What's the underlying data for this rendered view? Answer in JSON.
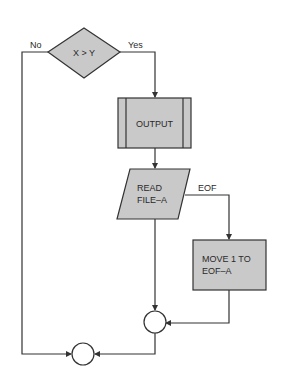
{
  "diagram": {
    "type": "flowchart",
    "colors": {
      "fill": "#c9c9c9",
      "stroke": "#333333",
      "background": "#ffffff"
    },
    "nodes": {
      "decision": {
        "shape": "diamond",
        "label": "X > Y"
      },
      "output": {
        "shape": "predefined-process",
        "label": "OUTPUT"
      },
      "read": {
        "shape": "parallelogram",
        "line1": "READ",
        "line2": "FILE–A"
      },
      "move": {
        "shape": "rectangle",
        "line1": "MOVE 1 TO",
        "line2": "EOF–A"
      },
      "connector_right": {
        "shape": "circle",
        "label": ""
      },
      "connector_bottom": {
        "shape": "circle",
        "label": ""
      }
    },
    "edges": {
      "no": {
        "label": "No",
        "from": "decision",
        "to": "connector_bottom"
      },
      "yes": {
        "label": "Yes",
        "from": "decision",
        "to": "output"
      },
      "output_to_read": {
        "label": "",
        "from": "output",
        "to": "read"
      },
      "eof": {
        "label": "EOF",
        "from": "read",
        "to": "move"
      },
      "read_to_connector": {
        "label": "",
        "from": "read",
        "to": "connector_right"
      },
      "move_to_connector": {
        "label": "",
        "from": "move",
        "to": "connector_right"
      },
      "connector_to_bottom": {
        "label": "",
        "from": "connector_right",
        "to": "connector_bottom"
      }
    }
  }
}
